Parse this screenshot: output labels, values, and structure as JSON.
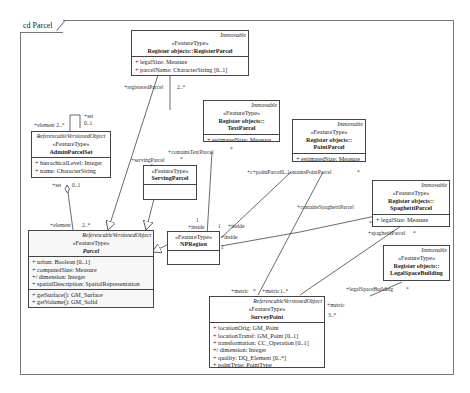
{
  "frame": {
    "title": "cd Parcel"
  },
  "classes": {
    "register_parcel": {
      "abstract": "Immovable",
      "stereotype": "«FeatureType»",
      "name": "Register objects::RegisterParcel",
      "attributes": [
        "+  legalSize: Measure",
        "+  parcelName: CharacterString [0..1]"
      ]
    },
    "admin_parcel_set": {
      "abstract": "ReferencableVersionedObject",
      "stereotype": "«FeatureType»",
      "name": "AdminParcelSet",
      "attributes": [
        "+ hierachicalLevel: Integer",
        "+ name: CharacterString"
      ]
    },
    "text_parcel": {
      "abstract": "Immovable",
      "stereotype": "«FeatureType»",
      "name_line1": "Register objects::",
      "name_line2": "TextParcel",
      "attributes": [
        "+  estimatedSize: Measure"
      ]
    },
    "point_parcel": {
      "abstract": "Immovable",
      "stereotype": "«FeatureType»",
      "name_line1": "Register objects::",
      "name_line2": "PointParcel",
      "attributes": [
        "+  estimatedSize: Measure"
      ]
    },
    "serving_parcel": {
      "stereotype": "«FeatureType»",
      "name": "ServingParcel"
    },
    "spaghetti_parcel": {
      "abstract": "Immovable",
      "stereotype": "«FeatureType»",
      "name_line1": "Register objects::",
      "name_line2": "SpaghettiParcel",
      "attributes": [
        "+  legalSize: Measure"
      ]
    },
    "np_region": {
      "stereotype": "«FeatureType»",
      "name": "NPRegion"
    },
    "legal_space_building": {
      "abstract": "Immovable",
      "stereotype": "«FeatureType»",
      "name_line1": "Register objects::",
      "name_line2": "LegalSpaceBuilding"
    },
    "parcel": {
      "abstract": "ReferencableVersionedObject",
      "stereotype": "«FeatureType»",
      "name": "Parcel",
      "attributes": [
        "+   urban: Boolean [0..1]",
        "+   computedSize: Measure",
        "+/  dimension: Integer",
        "+   spatialDescription: SpatialRepresentation"
      ],
      "operations": [
        "+   getSurface(): GM_Surface",
        "+   getVolume(): GM_Solid"
      ]
    },
    "survey_point": {
      "abstract": "ReferencableVersionedObject",
      "stereotype": "«FeatureType»",
      "name": "SurveyPoint",
      "attributes": [
        "+  locationOrig: GM_Point",
        "+  locationTransf: GM_Point [0..1]",
        "+  transformation: CC_Operation [0..1]",
        "+/ dimension: Integer",
        "+  quality: DQ_Element [0..*]",
        "+  pointType: PointType"
      ]
    }
  },
  "labels": {
    "set_top": "+set",
    "set_top_mult": "0..1",
    "element_top": "+element 2..*",
    "set_bottom": "+set",
    "set_bottom_mult": "0..1",
    "element_bottom": "+element",
    "element_bottom_mult": "2..*",
    "registered_parcel": "+registeredParcel",
    "registered_mult": "2..*",
    "contains_text_parcel": "+containsTextParcel",
    "contains_text_mult": "*",
    "serving_parcel": "+servingParcel",
    "serving_mult": "*",
    "text_star": "*",
    "cp_point": "+c+pointParcel0..1ontainsPointParcel",
    "point_star": "*",
    "contains_spaghetti": "+containsSpaghettiParcel",
    "spaghetti_parcel": "+spaghettiParcel",
    "spaghetti_star": "*",
    "spaghetti_side_star": "*",
    "legal_space_building": "+legalSpaceBuilding",
    "legal_star": "*",
    "inside_1": "+inside",
    "inside_1_mult": "1",
    "inside_2": "+inside",
    "inside_2_mult": "1",
    "inside_3": "+inside",
    "inside_3_mult": "1",
    "metric_1": "+metric",
    "metric_1_star": "*",
    "metric_2": "+metric",
    "metric_2_mult": "1..*",
    "metric_3": "+metric",
    "metric_3_mult": "3..*"
  }
}
